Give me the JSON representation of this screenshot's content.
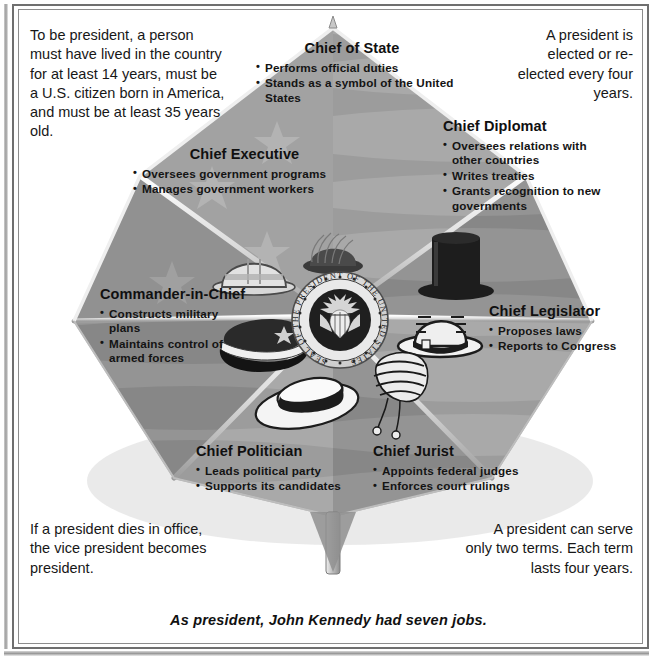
{
  "caption": "As president, John Kennedy had seven jobs.",
  "center": {
    "seal_name": "presidential-seal",
    "seal_text_outer": "SEAL OF THE PRESIDENT OF THE UNITED STATES"
  },
  "notes": {
    "top_left": "To be president, a person must have lived in the country for at least 14 years, must be a U.S. citizen born in America, and must be at least 35 years old.",
    "top_right": "A president is elected or re-elected every four years.",
    "bottom_left": "If a president dies in office, the vice president becomes president.",
    "bottom_right": "A president can serve only two terms.  Each term lasts four years."
  },
  "panels": [
    {
      "id": "chief-of-state",
      "title": "Chief of State",
      "bullets": [
        "Performs official duties",
        "Stands as a symbol of the United States"
      ],
      "icon": "feathered-hat-icon"
    },
    {
      "id": "chief-diplomat",
      "title": "Chief Diplomat",
      "bullets": [
        "Oversees relations with other countries",
        "Writes treaties",
        "Grants recognition to new governments"
      ],
      "icon": "top-hat-icon"
    },
    {
      "id": "chief-legislator",
      "title": "Chief Legislator",
      "bullets": [
        "Proposes laws",
        "Reports to Congress"
      ],
      "icon": "bowler-hat-icon"
    },
    {
      "id": "chief-jurist",
      "title": "Chief Jurist",
      "bullets": [
        "Appoints federal judges",
        "Enforces court rulings"
      ],
      "icon": "judge-wig-icon"
    },
    {
      "id": "chief-politician",
      "title": "Chief Politician",
      "bullets": [
        "Leads political party",
        "Supports its candidates"
      ],
      "icon": "boater-hat-icon"
    },
    {
      "id": "commander-in-chief",
      "title": "Commander-in-Chief",
      "bullets": [
        "Constructs military plans",
        "Maintains control of armed forces"
      ],
      "icon": "military-cap-icon"
    },
    {
      "id": "chief-executive",
      "title": "Chief Executive",
      "bullets": [
        "Oversees government programs",
        "Manages government workers"
      ],
      "icon": "hard-hat-icon"
    }
  ],
  "colors": {
    "panel_light": "#b4b4b4",
    "panel_mid": "#9d9d9d",
    "panel_dark": "#8a8a8a",
    "rib": "#e7e7e7",
    "text": "#141414",
    "frame": "#6f6f6f"
  }
}
